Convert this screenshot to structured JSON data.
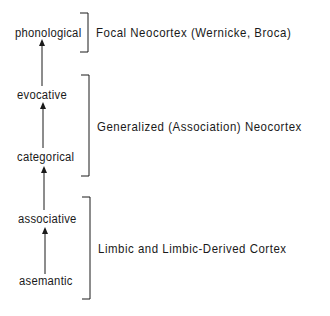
{
  "diagram": {
    "levels": [
      {
        "label": "phonological"
      },
      {
        "label": "evocative"
      },
      {
        "label": "categorical"
      },
      {
        "label": "associative"
      },
      {
        "label": "asemantic"
      }
    ],
    "regions": [
      {
        "label": "Focal Neocortex (Wernicke, Broca)",
        "spans": [
          "phonological"
        ]
      },
      {
        "label": "Generalized (Association) Neocortex",
        "spans": [
          "evocative",
          "categorical"
        ]
      },
      {
        "label": "Limbic and Limbic-Derived Cortex",
        "spans": [
          "associative",
          "asemantic"
        ]
      }
    ],
    "arrows": [
      {
        "from": "evocative",
        "to": "phonological"
      },
      {
        "from": "categorical",
        "to": "evocative"
      },
      {
        "from": "associative",
        "to": "categorical"
      },
      {
        "from": "asemantic",
        "to": "associative"
      }
    ],
    "colors": {
      "ink": "#1a1a1a",
      "background": "#ffffff"
    }
  }
}
